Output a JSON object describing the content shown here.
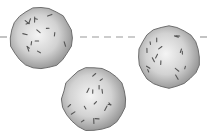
{
  "diagram": {
    "type": "spheres-with-dashed-line",
    "background": "#ffffff",
    "dashed_line": {
      "y": 37,
      "color": "#9a9a9a",
      "segments": [
        {
          "x1": 0,
          "x2": 8
        },
        {
          "x1": 80,
          "x2": 136
        },
        {
          "x1": 200,
          "x2": 212
        }
      ]
    },
    "spheres": [
      {
        "id": "sphere-left",
        "cx": 41,
        "cy": 38,
        "r": 31
      },
      {
        "id": "sphere-right",
        "cx": 169,
        "cy": 57,
        "r": 31
      },
      {
        "id": "sphere-bottom",
        "cx": 94,
        "cy": 99,
        "r": 32
      }
    ],
    "colors": {
      "sphere_light": "#f2f2f2",
      "sphere_mid": "#c8c8c8",
      "sphere_dark": "#8c8c8c",
      "outline": "#6e6e6e",
      "speck": "#555555"
    }
  }
}
